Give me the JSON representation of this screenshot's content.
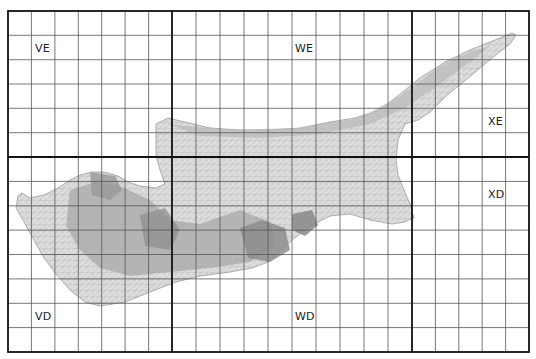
{
  "map": {
    "subject": "Cyprus geological map sheet index",
    "colors": {
      "grid_thin": "#555555",
      "grid_thick": "#111111",
      "land_light": "#d8d8d8",
      "land_mid": "#b5b5b5",
      "land_dark": "#8a8a8a",
      "background": "#ffffff"
    },
    "grid": {
      "left": 8,
      "top": 11,
      "right": 529,
      "bottom": 352,
      "thick_x": [
        8,
        172,
        412,
        529
      ],
      "thick_y": [
        11,
        157,
        352
      ],
      "rows": 14,
      "cols": 22
    },
    "sheet_labels": [
      {
        "id": "VE",
        "text": "VE",
        "x": 35,
        "y": 42
      },
      {
        "id": "WE",
        "text": "WE",
        "x": 296,
        "y": 42
      },
      {
        "id": "XE",
        "text": "XE",
        "x": 489,
        "y": 115
      },
      {
        "id": "XD",
        "text": "XD",
        "x": 489,
        "y": 188
      },
      {
        "id": "VD",
        "text": "VD",
        "x": 35,
        "y": 310
      },
      {
        "id": "WD",
        "text": "WD",
        "x": 295,
        "y": 310
      }
    ]
  }
}
